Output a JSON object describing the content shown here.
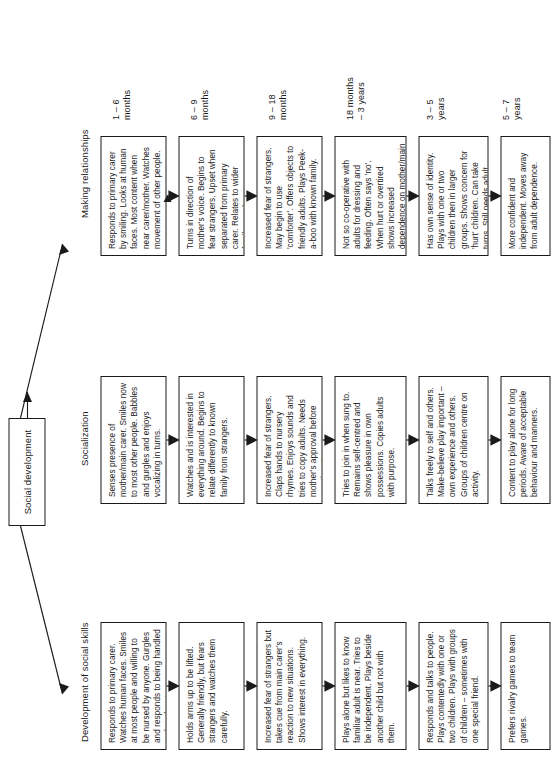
{
  "diagram": {
    "root_title": "Social development",
    "branches": [
      {
        "id": "making-relationships",
        "header": "Making relationships"
      },
      {
        "id": "socialization",
        "header": "Socialization"
      },
      {
        "id": "social-skills",
        "header": "Development of social skills"
      }
    ],
    "age_bands": [
      "1 – 6\nmonths",
      "6 – 9\nmonths",
      "9 – 18\nmonths",
      "18 months\n– 3 years",
      "3 – 5\nyears",
      "5 – 7\nyears"
    ],
    "rows": [
      {
        "age": "1 – 6 months",
        "making_relationships": "Responds to primary carer by smiling. Looks at human faces. Most content when near carer/mother. Watches movement of other people.",
        "socialization": "Senses presence of mother/main carer. Smiles now to most other people. Babbles and gurgles and enjoys vocalizing in turns.",
        "social_skills": "Responds to primary carer. Watches human faces. Smiles at most people and willing to be nursed by anyone. Gurgles and responds to being handled and spoken to."
      },
      {
        "age": "6 – 9 months",
        "making_relationships": "Turns in direction of mother's voice. Begins to fear strangers. Upset when separated from primary carer. Relates to wider family members.",
        "socialization": "Watches and is interested in everything around. Begins to relate differently to known family from strangers.",
        "social_skills": "Holds arms up to be lifted. Generally friendly, but fears strangers and watches them carefully."
      },
      {
        "age": "9 – 18 months",
        "making_relationships": "Increased fear of strangers. May begin to use 'comforter'. Offers objects to friendly adults. Plays Peek-a-boo with known family.",
        "socialization": "Increased fear of strangers. Claps hands to nursery rhymes. Enjoys sounds and tries to copy adults. Needs mother's approval before greeting strangers.",
        "social_skills": "Increased fear of strangers but takes cue from main carer's reaction to new situations. Shows interest in everything."
      },
      {
        "age": "18 months – 3 years",
        "making_relationships": "Not so co-operative with adults for dressing and feeding. Often says 'no'. When hurt or overtired shows increased dependence on mother/main carer. Enjoys sharing experiences.",
        "socialization": "Tries to join in when sung to. Remains self-centred and shows pleasure in own possessions. Copies adults with purpose.",
        "social_skills": "Plays alone but likes to know familiar adult is near. Tries to be independent. Plays beside another child but not with them."
      },
      {
        "age": "3 – 5 years",
        "making_relationships": "Has own sense of identity. Plays with one or two children then in larger groups. Shows concern for 'hurt' children. Can take turns. Still needs adult comfort and support.",
        "socialization": "Talks freely to self and others. Make-believe play important – own experience and others. Groups of children centre on activity.",
        "social_skills": "Responds and talks to people. Plays contentedly with one or two children. Plays with groups of children – sometimes with one special friend."
      },
      {
        "age": "5 – 7 years",
        "making_relationships": "More confident and independent. Moves away from adult dependence.",
        "socialization": "Content to play alone for long periods. Aware of acceptable behaviour and manners.",
        "social_skills": "Prefers rivalry games to team games."
      }
    ]
  }
}
